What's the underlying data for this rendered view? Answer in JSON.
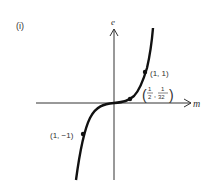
{
  "figure": {
    "panel_label": "(i)",
    "y_axis_label": "e",
    "x_axis_label": "m",
    "curve": "cubic e = m^3",
    "points": [
      {
        "label": "(1, 1)",
        "cx": 145,
        "cy": 72
      },
      {
        "label_num1": "1",
        "label_den1": "2",
        "label_num2": "1",
        "label_den2": "32",
        "cx": 130,
        "cy": 99
      },
      {
        "label": "(1, −1)",
        "cx": 83,
        "cy": 134
      }
    ],
    "colors": {
      "curve": "#111111",
      "axes": "#333333",
      "text": "#333333"
    }
  }
}
